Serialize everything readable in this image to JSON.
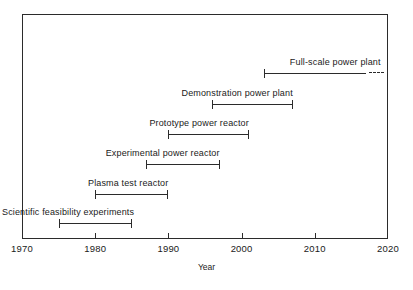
{
  "chart_data": {
    "type": "bar",
    "title": "",
    "subtitle": "",
    "xlabel": "Year",
    "ylabel": "",
    "xlim": [
      1970,
      2020
    ],
    "xticks": [
      1970,
      1980,
      1990,
      2000,
      2010,
      2020
    ],
    "xtick_labels": [
      "1970",
      "1980",
      "1990",
      "2000",
      "2010",
      "2020"
    ],
    "grid": false,
    "legend": null,
    "orientation": "horizontal",
    "categories": [
      "Full-scale power plant",
      "Demonstration power plant",
      "Prototype power reactor",
      "Experimental power reactor",
      "Plasma test reactor",
      "Scientific feasibility experiments"
    ],
    "bars": [
      {
        "label": "Full-scale power plant",
        "start": 2003,
        "end": 2017,
        "continues": true,
        "continues_to": 2019,
        "label_align": "right"
      },
      {
        "label": "Demonstration power plant",
        "start": 1996,
        "end": 2007,
        "continues": false,
        "label_align": "right"
      },
      {
        "label": "Prototype power reactor",
        "start": 1990,
        "end": 2001,
        "continues": false,
        "label_align": "right"
      },
      {
        "label": "Experimental power reactor",
        "start": 1987,
        "end": 1997,
        "continues": false,
        "label_align": "right"
      },
      {
        "label": "Plasma test reactor",
        "start": 1980,
        "end": 1990,
        "continues": false,
        "label_align": "right"
      },
      {
        "label": "Scientific feasibility experiments",
        "start": 1975,
        "end": 1985,
        "continues": false,
        "label_align": "right"
      }
    ],
    "annotations": [
      {
        "text": "dashed line indicates continuation beyond 2020",
        "applies_to": "Full-scale power plant"
      }
    ],
    "colors": {
      "line": "#2b2b2b",
      "frame": "#2b2b2b",
      "text": "#1a1a1a",
      "background": "#ffffff"
    }
  }
}
